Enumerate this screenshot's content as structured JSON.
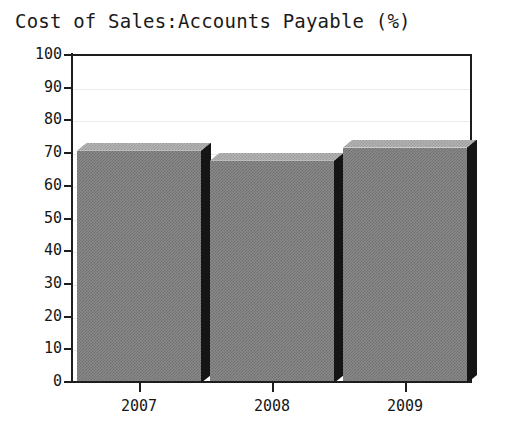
{
  "chart_data": {
    "type": "bar",
    "title": "Cost of Sales:Accounts Payable (%)",
    "xlabel": "",
    "ylabel": "",
    "categories": [
      "2007",
      "2008",
      "2009"
    ],
    "values": [
      71,
      68,
      72
    ],
    "series": [
      {
        "name": "Cost of Sales:Accounts Payable (%)",
        "values": [
          71,
          68,
          72
        ]
      }
    ],
    "ylim": [
      0,
      100
    ],
    "ytick_labels": [
      "0",
      "10",
      "20",
      "30",
      "40",
      "50",
      "60",
      "70",
      "80",
      "90",
      "100"
    ],
    "ytick_values": [
      0,
      10,
      20,
      30,
      40,
      50,
      60,
      70,
      80,
      90,
      100
    ],
    "xtick_labels": [
      "2007",
      "2008",
      "2009"
    ],
    "grid": true,
    "legend": false,
    "legend_position": "none",
    "style": "3d-bar",
    "colors": {
      "bar_front": "#8a8a8a",
      "bar_top": "#b4b4b4",
      "bar_side": "#151515",
      "axis": "#1d1d1d",
      "grid": "#eceaea",
      "text": "#161616",
      "background": "#ffffff"
    }
  },
  "axes": {
    "y_ticks": [
      {
        "label": "100",
        "value": 100
      },
      {
        "label": "90",
        "value": 90
      },
      {
        "label": "80",
        "value": 80
      },
      {
        "label": "70",
        "value": 70
      },
      {
        "label": "60",
        "value": 60
      },
      {
        "label": "50",
        "value": 50
      },
      {
        "label": "40",
        "value": 40
      },
      {
        "label": "30",
        "value": 30
      },
      {
        "label": "20",
        "value": 20
      },
      {
        "label": "10",
        "value": 10
      },
      {
        "label": "0",
        "value": 0
      }
    ],
    "x_ticks": [
      {
        "label": "2007"
      },
      {
        "label": "2008"
      },
      {
        "label": "2009"
      }
    ]
  }
}
